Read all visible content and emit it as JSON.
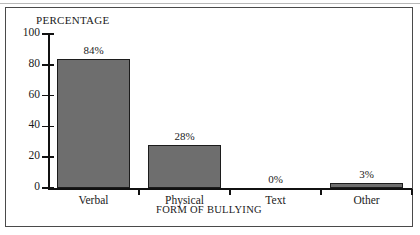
{
  "figure": {
    "frame_border_color": "#4a4a4a",
    "background": "#ffffff"
  },
  "chart_data": {
    "type": "bar",
    "title": "",
    "subtitle": "",
    "xlabel": "FORM OF BULLYING",
    "ylabel": "PERCENTAGE",
    "categories": [
      "Verbal",
      "Physical",
      "Text",
      "Other"
    ],
    "values": [
      84,
      28,
      0,
      3
    ],
    "data_labels": [
      "84%",
      "28%",
      "0%",
      "3%"
    ],
    "ylim": [
      0,
      100
    ],
    "yticks": [
      0,
      20,
      40,
      60,
      80,
      100
    ],
    "ytick_labels": [
      "0",
      "20",
      "40",
      "60",
      "80",
      "100"
    ],
    "grid": false,
    "legend": null,
    "bar_color": "#6e6e6e",
    "bar_edge_color": "#1c1c1c",
    "axis_color": "#111111"
  }
}
